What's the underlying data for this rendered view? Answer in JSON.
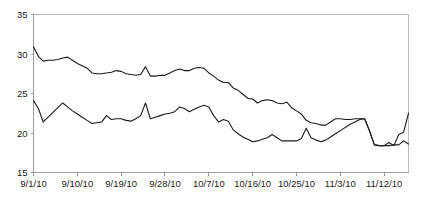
{
  "chart_data": {
    "type": "line",
    "title": "",
    "subtitle": "",
    "xlabel": "",
    "ylabel": "",
    "ylim": [
      15,
      35
    ],
    "yticks": [
      15,
      20,
      25,
      30,
      35
    ],
    "ytick_labels": [
      "15",
      "20",
      "25",
      "30",
      "35"
    ],
    "xtick_labels": [
      "9/1/10",
      "9/10/10",
      "9/19/10",
      "9/28/10",
      "10/7/10",
      "10/16/10",
      "10/25/10",
      "11/3/10",
      "11/12/10"
    ],
    "xtick_indices": [
      0,
      9,
      18,
      27,
      36,
      45,
      54,
      63,
      72
    ],
    "x_start": "9/1/10",
    "x_end": "11/17/10",
    "n_points": 78,
    "grid": false,
    "legend": "none",
    "line_color": "#1a1a1a",
    "axis_color": "#9a9a9a",
    "series": [
      {
        "name": "upper",
        "values": [
          30.9,
          29.7,
          29.1,
          29.2,
          29.2,
          29.3,
          29.5,
          29.6,
          29.2,
          28.8,
          28.5,
          28.2,
          27.6,
          27.5,
          27.5,
          27.6,
          27.7,
          27.9,
          27.8,
          27.5,
          27.4,
          27.3,
          27.4,
          28.4,
          27.2,
          27.2,
          27.3,
          27.3,
          27.6,
          27.9,
          28.1,
          27.9,
          27.9,
          28.2,
          28.3,
          28.2,
          27.6,
          27.2,
          26.7,
          26.4,
          26.4,
          25.7,
          25.4,
          24.9,
          24.4,
          24.3,
          23.8,
          24.1,
          24.2,
          24.1,
          23.8,
          23.7,
          23.9,
          23.2,
          22.8,
          22.4,
          21.6,
          21.3,
          21.2,
          21.0,
          21.0,
          21.4,
          21.8,
          21.8,
          21.7,
          21.7,
          21.8,
          21.8,
          21.8,
          20.2,
          18.5,
          18.4,
          18.4,
          18.4,
          18.5,
          18.5,
          19.0,
          18.6
        ]
      },
      {
        "name": "lower",
        "values": [
          24.1,
          23.1,
          21.4,
          22.0,
          22.6,
          23.2,
          23.8,
          23.3,
          22.8,
          22.4,
          22.0,
          21.6,
          21.2,
          21.3,
          21.4,
          22.2,
          21.7,
          21.8,
          21.8,
          21.6,
          21.5,
          21.8,
          22.2,
          23.8,
          21.8,
          22.0,
          22.2,
          22.4,
          22.5,
          22.7,
          23.3,
          23.1,
          22.7,
          23.0,
          23.3,
          23.5,
          23.3,
          22.2,
          21.4,
          21.7,
          21.5,
          20.4,
          19.9,
          19.5,
          19.2,
          18.9,
          19.0,
          19.2,
          19.4,
          19.8,
          19.4,
          19.0,
          19.0,
          19.0,
          19.0,
          19.3,
          20.6,
          19.4,
          19.1,
          18.9,
          19.1,
          19.5,
          19.9,
          20.3,
          20.7,
          21.1,
          21.4,
          21.7,
          21.8,
          20.3,
          18.5,
          18.4,
          18.4,
          18.8,
          18.4,
          19.8,
          20.1,
          22.5
        ]
      }
    ]
  }
}
